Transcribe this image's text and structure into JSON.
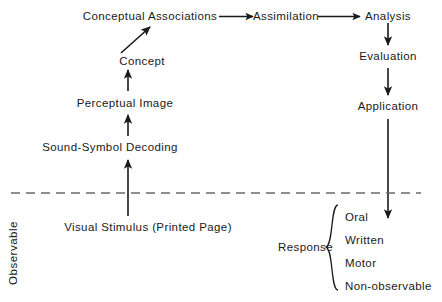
{
  "diagram": {
    "divider": {
      "name": "observable-boundary",
      "style": "dashed",
      "y": 193
    },
    "side_label": {
      "text": "Observable",
      "orientation": "vertical"
    },
    "nodes": {
      "conceptual_associations": "Conceptual  Associations",
      "assimilation": "Assimilation",
      "analysis": "Analysis",
      "evaluation": "Evaluation",
      "application": "Application",
      "concept": "Concept",
      "perceptual_image": "Perceptual  Image",
      "sound_symbol_decoding": "Sound-Symbol  Decoding",
      "visual_stimulus": "Visual  Stimulus  (Printed  Page)",
      "response": "Response"
    },
    "response_items": [
      "Oral",
      "Written",
      "Motor",
      "Non-observable"
    ],
    "colors": {
      "ink": "#1a1a1a",
      "background": "#ffffff",
      "divider": "#6b6b6b"
    }
  }
}
